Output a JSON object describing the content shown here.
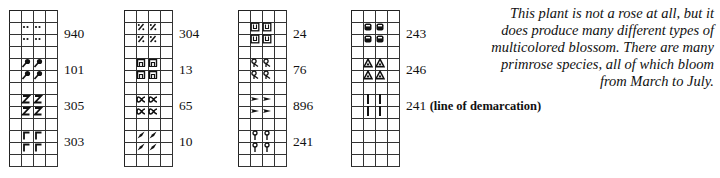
{
  "grid": {
    "columns": 4,
    "rows": 13,
    "cell_px": 12,
    "line_color": "#333333"
  },
  "charts": [
    {
      "id": "chart-1",
      "groups": [
        {
          "code": "940",
          "note": "",
          "symbol": "dots-icon"
        },
        {
          "code": "101",
          "note": "",
          "symbol": "pin-leaf-icon"
        },
        {
          "code": "305",
          "note": "",
          "symbol": "z-icon"
        },
        {
          "code": "303",
          "note": "",
          "symbol": "corner-bracket-icon"
        }
      ]
    },
    {
      "id": "chart-2",
      "groups": [
        {
          "code": "304",
          "note": "",
          "symbol": "percent-icon"
        },
        {
          "code": "13",
          "note": "",
          "symbol": "arch-box-icon"
        },
        {
          "code": "65",
          "note": "",
          "symbol": "alpha-icon"
        },
        {
          "code": "10",
          "note": "",
          "symbol": "wedge-icon"
        }
      ]
    },
    {
      "id": "chart-3",
      "groups": [
        {
          "code": "24",
          "note": "",
          "symbol": "u-box-icon"
        },
        {
          "code": "76",
          "note": "",
          "symbol": "loop-stem-icon"
        },
        {
          "code": "896",
          "note": "",
          "symbol": "arrowhead-icon"
        },
        {
          "code": "241",
          "note": "",
          "symbol": "lollipop-icon"
        }
      ]
    },
    {
      "id": "chart-4",
      "groups": [
        {
          "code": "243",
          "note": "",
          "symbol": "filled-rounded-square-icon"
        },
        {
          "code": "246",
          "note": "",
          "symbol": "triangle-outline-icon"
        },
        {
          "code": "241",
          "note": "(line of demarcation)",
          "symbol": "vertical-bar-icon"
        }
      ]
    }
  ],
  "description": {
    "lines": [
      "This plant is not a rose at all, but it",
      "does produce many different types of",
      "multicolored blossom. There are many",
      "primrose species, all of which bloom",
      "from March to July."
    ]
  }
}
